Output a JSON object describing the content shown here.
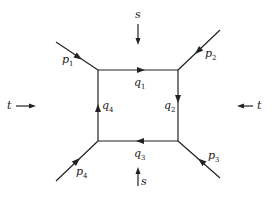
{
  "diagram": {
    "type": "box-diagram",
    "colors": {
      "line": "#222222",
      "background": "#ffffff"
    },
    "loop_momenta": [
      {
        "id": "q1",
        "base": "q",
        "sub": "1",
        "edge": "top",
        "direction": "right"
      },
      {
        "id": "q2",
        "base": "q",
        "sub": "2",
        "edge": "right",
        "direction": "down"
      },
      {
        "id": "q3",
        "base": "q",
        "sub": "3",
        "edge": "bottom",
        "direction": "left"
      },
      {
        "id": "q4",
        "base": "q",
        "sub": "4",
        "edge": "left",
        "direction": "up"
      }
    ],
    "external_momenta": [
      {
        "id": "p1",
        "base": "p",
        "sub": "1",
        "corner": "top-left",
        "direction": "inward"
      },
      {
        "id": "p2",
        "base": "p",
        "sub": "2",
        "corner": "top-right",
        "direction": "inward"
      },
      {
        "id": "p3",
        "base": "p",
        "sub": "3",
        "corner": "bottom-right",
        "direction": "inward"
      },
      {
        "id": "p4",
        "base": "p",
        "sub": "4",
        "corner": "bottom-left",
        "direction": "inward"
      }
    ],
    "channels": [
      {
        "id": "s_top",
        "label": "s",
        "position": "top",
        "direction": "down"
      },
      {
        "id": "s_bottom",
        "label": "s",
        "position": "bottom",
        "direction": "up"
      },
      {
        "id": "t_left",
        "label": "t",
        "position": "left",
        "direction": "right"
      },
      {
        "id": "t_right",
        "label": "t",
        "position": "right",
        "direction": "left"
      }
    ]
  }
}
